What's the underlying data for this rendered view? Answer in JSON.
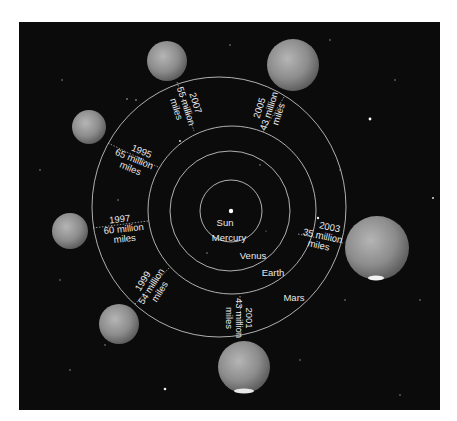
{
  "diagram": {
    "center": {
      "label": "Sun"
    },
    "orbits": [
      {
        "name": "Mercury",
        "label": "Mercury"
      },
      {
        "name": "Venus",
        "label": "Venus"
      },
      {
        "name": "Earth",
        "label": "Earth"
      },
      {
        "name": "Mars",
        "label": "Mars"
      }
    ],
    "oppositions": [
      {
        "year": "2007",
        "distance": "55 million",
        "unit": "miles"
      },
      {
        "year": "2005",
        "distance": "43 million",
        "unit": "miles"
      },
      {
        "year": "1995",
        "distance": "65 million",
        "unit": "miles"
      },
      {
        "year": "1997",
        "distance": "60 million",
        "unit": "miles"
      },
      {
        "year": "2003",
        "distance": "35 million",
        "unit": "miles"
      },
      {
        "year": "1999",
        "distance": "54 million",
        "unit": "miles"
      },
      {
        "year": "2001",
        "distance": "43 million",
        "unit": "miles"
      }
    ],
    "colors": {
      "background": "#0b0b0b",
      "orbit": "#d9d9d9",
      "text": "#e8e8e8",
      "mars": "#8a8a8a"
    }
  }
}
